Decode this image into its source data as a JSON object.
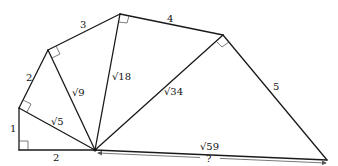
{
  "diagram": {
    "points": {
      "P0": [
        19,
        150
      ],
      "P1": [
        19,
        108
      ],
      "P2": [
        48,
        50
      ],
      "P3": [
        120,
        14
      ],
      "P4": [
        223,
        35
      ],
      "P5": [
        327,
        160
      ],
      "O": [
        95,
        150
      ]
    },
    "labels": {
      "side_bottom": "2",
      "side_left": "1",
      "side_2": "2",
      "side_3": "3",
      "side_4": "4",
      "side_5": "5",
      "hyp_1": "√5",
      "hyp_2": "√9",
      "hyp_3": "√18",
      "hyp_4": "√34",
      "hyp_5": "√59",
      "unknown": "?"
    }
  }
}
